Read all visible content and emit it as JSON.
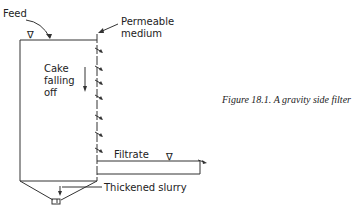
{
  "diagram": {
    "labels": {
      "feed": "Feed",
      "permeable_medium_line1": "Permeable",
      "permeable_medium_line2": "medium",
      "cake_line1": "Cake",
      "cake_line2": "falling",
      "cake_line3": "off",
      "filtrate": "Filtrate",
      "thickened_slurry": "Thickened slurry"
    },
    "symbols": {
      "liquid_level": "∇"
    },
    "caption": "Figure 18.1. A gravity side filter",
    "colors": {
      "line": "#333333",
      "text": "#222222",
      "background": "#ffffff"
    }
  }
}
